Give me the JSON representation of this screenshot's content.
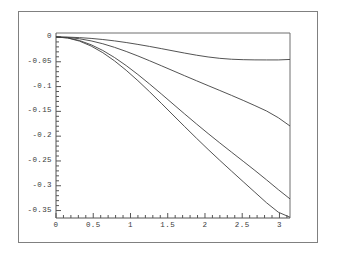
{
  "figure": {
    "background_color": "#ffffff",
    "frame_color": "#808080",
    "axis_color": "#555555",
    "curve_color": "#404040",
    "label_color": "#3a3a3a"
  },
  "chart_data": {
    "type": "line",
    "title": "",
    "subtitle": "",
    "xlabel": "",
    "ylabel": "",
    "xlim": [
      0,
      3.14159
    ],
    "ylim": [
      -0.365,
      0.008
    ],
    "grid": false,
    "legend": null,
    "legend_position": "none",
    "x_ticks": [
      0,
      0.5,
      1,
      1.5,
      2,
      2.5,
      3
    ],
    "x_tick_labels": [
      "0",
      "0.5",
      "1",
      "1.5",
      "2",
      "2.5",
      "3"
    ],
    "x_minor_ticks": [
      0.1,
      0.2,
      0.3,
      0.4,
      0.6,
      0.7,
      0.8,
      0.9,
      1.1,
      1.2,
      1.3,
      1.4,
      1.6,
      1.7,
      1.8,
      1.9,
      2.1,
      2.2,
      2.3,
      2.4,
      2.6,
      2.7,
      2.8,
      2.9,
      3.1
    ],
    "y_ticks": [
      0,
      -0.05,
      -0.1,
      -0.15,
      -0.2,
      -0.25,
      -0.3,
      -0.35
    ],
    "y_tick_labels": [
      "0",
      "-0.05",
      "-0.1",
      "-0.15",
      "-0.2",
      "-0.25",
      "-0.3",
      "-0.35"
    ],
    "y_minor_ticks": [
      -0.01,
      -0.02,
      -0.03,
      -0.04,
      -0.06,
      -0.07,
      -0.08,
      -0.09,
      -0.11,
      -0.12,
      -0.13,
      -0.14,
      -0.16,
      -0.17,
      -0.18,
      -0.19,
      -0.21,
      -0.22,
      -0.23,
      -0.24,
      -0.26,
      -0.27,
      -0.28,
      -0.29,
      -0.31,
      -0.32,
      -0.33,
      -0.34
    ],
    "x": [
      0,
      0.15708,
      0.31416,
      0.47124,
      0.62832,
      0.7854,
      0.94248,
      1.09956,
      1.25664,
      1.41372,
      1.5708,
      1.72788,
      1.88496,
      2.04204,
      2.19911,
      2.35619,
      2.51327,
      2.67035,
      2.82743,
      2.98451,
      3.14159
    ],
    "series": [
      {
        "name": "curve-1",
        "values": [
          0,
          -0.0003,
          -0.0013,
          -0.0029,
          -0.0051,
          -0.0079,
          -0.0112,
          -0.015,
          -0.0191,
          -0.0235,
          -0.028,
          -0.0325,
          -0.0367,
          -0.0403,
          -0.0431,
          -0.0449,
          -0.0458,
          -0.0462,
          -0.0463,
          -0.0463,
          -0.0453
        ]
      },
      {
        "name": "curve-2",
        "values": [
          0,
          -0.0009,
          -0.0036,
          -0.0079,
          -0.0137,
          -0.0209,
          -0.0292,
          -0.0383,
          -0.048,
          -0.058,
          -0.0681,
          -0.0782,
          -0.0882,
          -0.0981,
          -0.1079,
          -0.1178,
          -0.1279,
          -0.1384,
          -0.1493,
          -0.1628,
          -0.1795
        ]
      },
      {
        "name": "curve-3",
        "values": [
          0,
          -0.0018,
          -0.0071,
          -0.0157,
          -0.0272,
          -0.0414,
          -0.0577,
          -0.0757,
          -0.0949,
          -0.1148,
          -0.1351,
          -0.1553,
          -0.1752,
          -0.1947,
          -0.2136,
          -0.2322,
          -0.2506,
          -0.2691,
          -0.2882,
          -0.3078,
          -0.3265
        ]
      },
      {
        "name": "curve-4",
        "values": [
          0,
          -0.0021,
          -0.0083,
          -0.0183,
          -0.0317,
          -0.0482,
          -0.0672,
          -0.0881,
          -0.1105,
          -0.1337,
          -0.1573,
          -0.1808,
          -0.204,
          -0.2267,
          -0.2488,
          -0.2704,
          -0.2918,
          -0.3131,
          -0.3344,
          -0.3533,
          -0.3635
        ]
      }
    ]
  },
  "geometry": {
    "plot_left": 56,
    "plot_right": 290,
    "plot_top": 33,
    "plot_bottom": 218,
    "axis_zero_y": 38
  }
}
